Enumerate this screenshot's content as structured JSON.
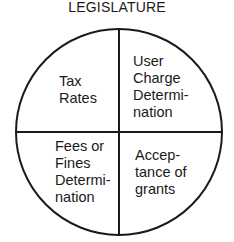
{
  "title": "LEGISLATURE",
  "quadrants": {
    "top_left": {
      "lines": [
        "Tax",
        "Rates"
      ]
    },
    "top_right": {
      "lines": [
        "User",
        "Charge",
        "Determi-",
        "nation"
      ]
    },
    "bottom_left": {
      "lines": [
        "Fees or",
        "Fines",
        "Determi-",
        "nation"
      ]
    },
    "bottom_right": {
      "lines": [
        "Accep-",
        "tance of",
        "grants"
      ]
    }
  },
  "colors": {
    "stroke": "#1a1a1a",
    "background": "#ffffff"
  }
}
